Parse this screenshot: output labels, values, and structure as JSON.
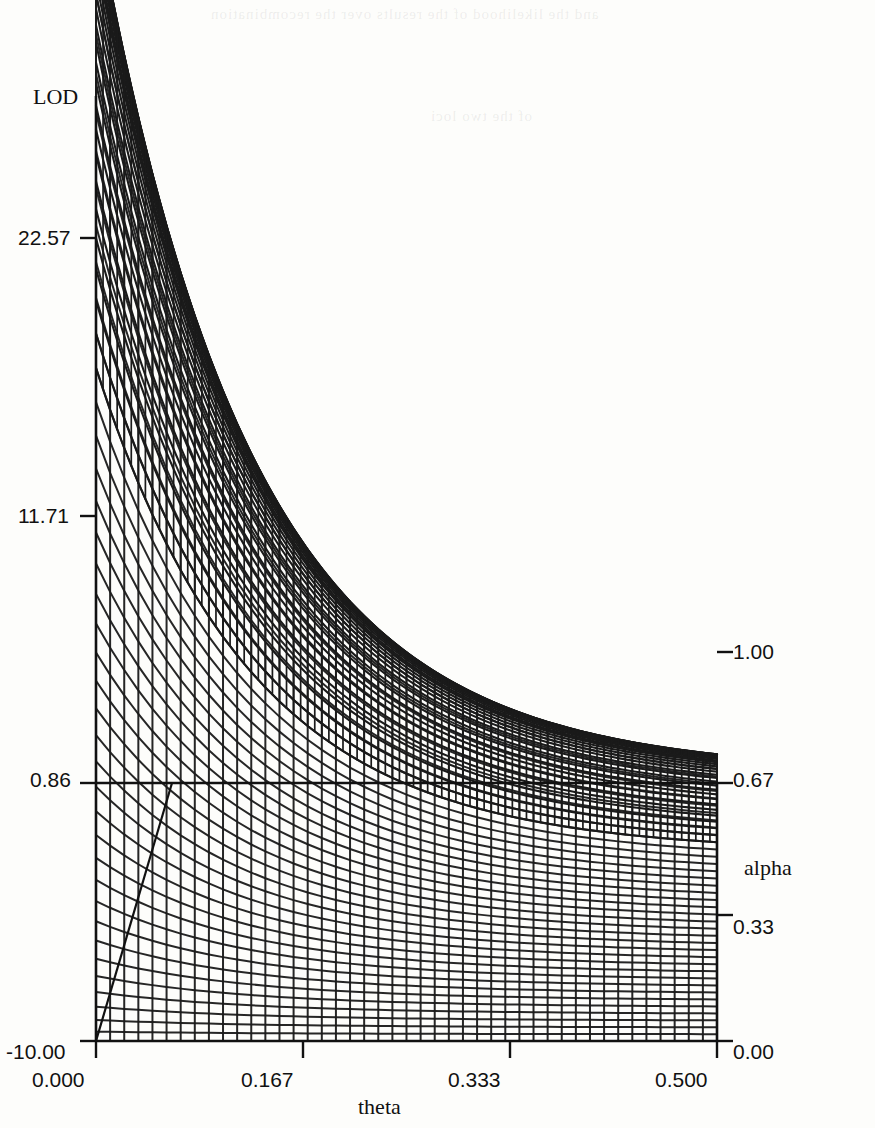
{
  "chart_data": {
    "type": "line",
    "plot_kind": "3d-wireframe-surface",
    "title": "",
    "zlabel": "LOD",
    "xlabel": "theta",
    "ylabel": "alpha",
    "z_axis": {
      "label": "LOD",
      "ticks": [
        "-10.00",
        "0.86",
        "11.71",
        "22.57"
      ],
      "tick_values": [
        -10.0,
        0.86,
        11.71,
        22.57
      ],
      "range": [
        -10.0,
        33.42
      ]
    },
    "x_axis": {
      "label": "theta",
      "ticks": [
        "0.000",
        "0.167",
        "0.333",
        "0.500"
      ],
      "tick_values": [
        0.0,
        0.167,
        0.333,
        0.5
      ],
      "range": [
        0.0,
        0.5
      ]
    },
    "y_axis": {
      "label": "alpha",
      "ticks": [
        "0.00",
        "0.33",
        "0.67",
        "1.00"
      ],
      "tick_values": [
        0.0,
        0.33,
        0.67,
        1.0
      ],
      "range": [
        0.0,
        1.0
      ]
    },
    "surface": {
      "description": "LOD score surface over recombination fraction theta and admixture proportion alpha; maximum at theta=0, alpha=1",
      "peak_lod": 33.4,
      "peak_at": {
        "theta": 0.0,
        "alpha": 1.0
      },
      "mesh_rows": 40,
      "mesh_cols": 44,
      "grid": true
    },
    "legend": [],
    "grid": false
  },
  "axes": {
    "z": {
      "label": "LOD",
      "ticks": [
        {
          "text": "22.57",
          "pos": 0.2
        },
        {
          "text": "11.71",
          "pos": 0.6
        },
        {
          "text": "0.86",
          "pos": 1.0
        },
        {
          "text": "-10.00",
          "pos": 1.4
        }
      ]
    },
    "x": {
      "label": "theta",
      "ticks": [
        {
          "text": "0.000",
          "pos": 0.0
        },
        {
          "text": "0.167",
          "pos": 0.334
        },
        {
          "text": "0.333",
          "pos": 0.666
        },
        {
          "text": "0.500",
          "pos": 1.0
        }
      ]
    },
    "y": {
      "label": "alpha",
      "ticks": [
        {
          "text": "1.00",
          "pos": 1.0
        },
        {
          "text": "0.67",
          "pos": 0.67
        },
        {
          "text": "0.33",
          "pos": 0.33
        },
        {
          "text": "0.00",
          "pos": 0.0
        }
      ]
    }
  },
  "colors": {
    "ink": "#111111",
    "paper": "#fdfdfb",
    "mesh": "#1a1a1a"
  },
  "bleed_text": {
    "line1": "and the likelihood of the results over the recombination",
    "line2": "of the two loci"
  }
}
